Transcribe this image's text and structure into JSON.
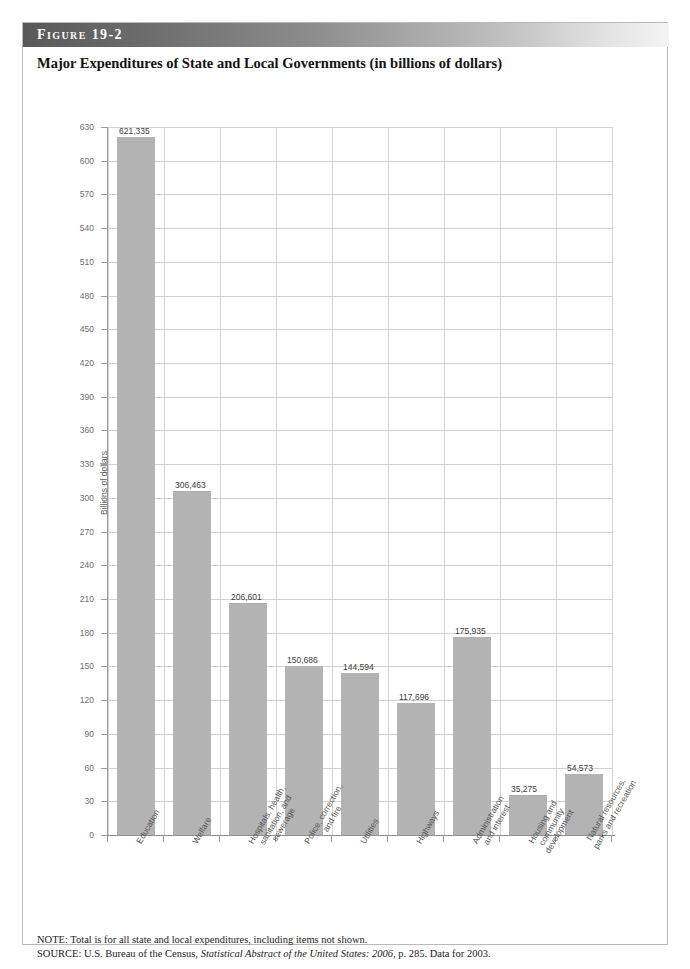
{
  "figure": {
    "band_label": "Figure  19-2",
    "title": "Major Expenditures of State and Local Governments (in billions of dollars)"
  },
  "chart_data": {
    "type": "bar",
    "title": "Major Expenditures of State and Local Governments (in billions of dollars)",
    "xlabel": "",
    "ylabel": "Billions of dollars",
    "ylim": [
      0,
      630
    ],
    "ytick_step": 30,
    "grid": true,
    "legend": "none",
    "categories": [
      "Education",
      "Welfare",
      "Hospitals, health,\nsanitation, and\nsewerage",
      "Police, correction,\nand fire",
      "Utilities",
      "Highways",
      "Administration\nand interest",
      "Housing and\ncommunity\ndevelopment",
      "Natural resources,\nparks and recreation"
    ],
    "values": [
      621.335,
      306.463,
      206.601,
      150.686,
      144.594,
      117.696,
      175.935,
      35.275,
      54.573
    ],
    "data_labels": [
      "621,335",
      "306,463",
      "206,601",
      "150,686",
      "144,594",
      "117,696",
      "175,935",
      "35,275",
      "54,573"
    ],
    "ytick_labels": [
      "630",
      "600",
      "570",
      "540",
      "510",
      "480",
      "450",
      "420",
      "390",
      "360",
      "330",
      "300",
      "270",
      "240",
      "210",
      "180",
      "150",
      "120",
      "90",
      "60",
      "30",
      "0"
    ],
    "bar_color": "#b3b3b3",
    "annotation": "Total: $1.8 trillion"
  },
  "notes": {
    "note_line": "NOTE: Total is for all state and local expenditures, including items not shown.",
    "source_prefix": "SOURCE: U.S. Bureau of the Census, ",
    "source_italic": "Statistical Abstract of the United States: 2006",
    "source_suffix": ", p. 285. Data for 2003."
  }
}
